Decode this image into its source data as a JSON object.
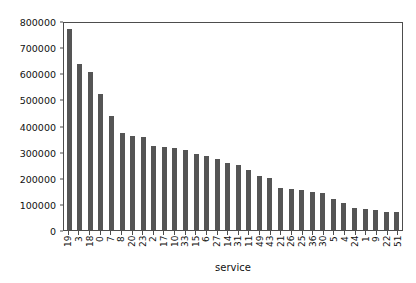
{
  "chart_data": {
    "type": "bar",
    "title": "",
    "xlabel": "service",
    "ylabel": "",
    "ylim": [
      0,
      800000
    ],
    "yticks": [
      0,
      100000,
      200000,
      300000,
      400000,
      500000,
      600000,
      700000,
      800000
    ],
    "ytick_labels": [
      "0",
      "100000",
      "200000",
      "300000",
      "400000",
      "500000",
      "600000",
      "700000",
      "800000"
    ],
    "grid": false,
    "legend": false,
    "bar_color": "#555555",
    "axis_color": "#4d4d4d",
    "xtick_rotation": 90,
    "categories": [
      "19",
      "3",
      "18",
      "0",
      "7",
      "8",
      "20",
      "23",
      "2",
      "17",
      "10",
      "33",
      "15",
      "6",
      "27",
      "14",
      "31",
      "11",
      "49",
      "43",
      "21",
      "26",
      "25",
      "36",
      "30",
      "5",
      "4",
      "24",
      "1",
      "9",
      "22",
      "51"
    ],
    "values": [
      770000,
      635000,
      605000,
      520000,
      437000,
      370000,
      358000,
      355000,
      320000,
      318000,
      315000,
      305000,
      292000,
      283000,
      270000,
      258000,
      248000,
      228000,
      205000,
      198000,
      160000,
      157000,
      152000,
      145000,
      143000,
      118000,
      105000,
      83000,
      80000,
      77000,
      70000,
      68000
    ]
  }
}
